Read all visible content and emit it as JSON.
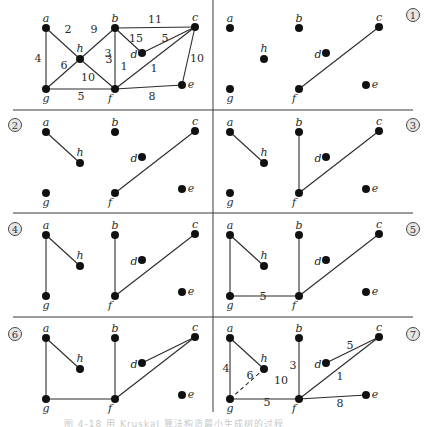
{
  "figure": {
    "vertices": [
      {
        "id": "a",
        "label": "a",
        "x": 46,
        "y": 28,
        "lx": 0,
        "ly": -6,
        "anchor": "middle"
      },
      {
        "id": "b",
        "label": "b",
        "x": 115,
        "y": 28,
        "lx": 0,
        "ly": -6,
        "anchor": "middle"
      },
      {
        "id": "c",
        "label": "c",
        "x": 195,
        "y": 27,
        "lx": 0,
        "ly": -6,
        "anchor": "middle"
      },
      {
        "id": "h",
        "label": "h",
        "x": 80,
        "y": 59,
        "lx": 0,
        "ly": -7,
        "anchor": "middle"
      },
      {
        "id": "d",
        "label": "d",
        "x": 142,
        "y": 53,
        "lx": -8,
        "ly": 5,
        "anchor": "middle"
      },
      {
        "id": "g",
        "label": "g",
        "x": 46,
        "y": 89,
        "lx": 0,
        "ly": 13,
        "anchor": "middle"
      },
      {
        "id": "f",
        "label": "f",
        "x": 115,
        "y": 89,
        "lx": -5,
        "ly": 13,
        "anchor": "middle"
      },
      {
        "id": "e",
        "label": "e",
        "x": 182,
        "y": 85,
        "lx": 9,
        "ly": 3,
        "anchor": "middle"
      }
    ],
    "graph_edges": [
      {
        "u": "a",
        "v": "h",
        "w": "2",
        "wx": 68,
        "wy": 33
      },
      {
        "u": "a",
        "v": "g",
        "w": "4",
        "wx": 38,
        "wy": 62
      },
      {
        "u": "h",
        "v": "b",
        "w": "9",
        "wx": 94,
        "wy": 33
      },
      {
        "u": "h",
        "v": "g",
        "w": "6",
        "wx": 64,
        "wy": 69
      },
      {
        "u": "h",
        "v": "f",
        "w": "10",
        "wx": 88,
        "wy": 81
      },
      {
        "u": "b",
        "v": "c",
        "w": "11",
        "wx": 155,
        "wy": 23
      },
      {
        "u": "b",
        "v": "d",
        "w": "15",
        "wx": 136,
        "wy": 42
      },
      {
        "u": "b",
        "v": "f",
        "w": "3",
        "wx": 109,
        "wy": 63
      },
      {
        "u": "d",
        "v": "c",
        "w": "5",
        "wx": 165,
        "wy": 42
      },
      {
        "u": "f",
        "v": "c",
        "w": "1",
        "wx": 154,
        "wy": 72
      },
      {
        "u": "c",
        "v": "e",
        "w": "10",
        "wx": 197,
        "wy": 62
      },
      {
        "u": "g",
        "v": "f",
        "w": "5",
        "wx": 81,
        "wy": 100
      },
      {
        "u": "f",
        "v": "e",
        "w": "8",
        "wx": 152,
        "wy": 100
      }
    ],
    "panels": [
      {
        "id": "graph",
        "dx": 0,
        "dy": 0,
        "step": "",
        "full_graph": true,
        "edges": [],
        "weights": [],
        "dashed": []
      },
      {
        "id": "step-1",
        "dx": 184,
        "dy": 0,
        "step": "1",
        "edges": [
          [
            "f",
            "c"
          ]
        ],
        "weights": [
          {
            "text": "1",
            "x": 124,
            "y": 70
          }
        ],
        "dashed": []
      },
      {
        "id": "step-2",
        "dx": 0,
        "dy": 104,
        "step": "2",
        "edges": [
          [
            "a",
            "h"
          ],
          [
            "f",
            "c"
          ]
        ],
        "weights": [
          {
            "text": "3",
            "x": 108,
            "y": 57
          }
        ],
        "dashed": []
      },
      {
        "id": "step-3",
        "dx": 184,
        "dy": 104,
        "step": "3",
        "edges": [
          [
            "a",
            "h"
          ],
          [
            "b",
            "f"
          ],
          [
            "f",
            "c"
          ]
        ],
        "weights": [],
        "dashed": []
      },
      {
        "id": "step-4",
        "dx": 0,
        "dy": 207,
        "step": "4",
        "edges": [
          [
            "a",
            "h"
          ],
          [
            "a",
            "g"
          ],
          [
            "b",
            "f"
          ],
          [
            "f",
            "c"
          ]
        ],
        "weights": [],
        "dashed": []
      },
      {
        "id": "step-5",
        "dx": 184,
        "dy": 207,
        "step": "5",
        "edges": [
          [
            "a",
            "h"
          ],
          [
            "a",
            "g"
          ],
          [
            "g",
            "f"
          ],
          [
            "b",
            "f"
          ],
          [
            "f",
            "c"
          ]
        ],
        "weights": [
          {
            "text": "5",
            "x": 263,
            "y": 300
          }
        ],
        "dashed": []
      },
      {
        "id": "step-6",
        "dx": 0,
        "dy": 310,
        "step": "6",
        "edges": [
          [
            "a",
            "h"
          ],
          [
            "a",
            "g"
          ],
          [
            "g",
            "f"
          ],
          [
            "b",
            "f"
          ],
          [
            "f",
            "c"
          ],
          [
            "d",
            "c"
          ]
        ],
        "weights": [],
        "dashed": []
      },
      {
        "id": "step-7",
        "dx": 184,
        "dy": 310,
        "step": "7",
        "edges": [
          [
            "a",
            "h"
          ],
          [
            "a",
            "g"
          ],
          [
            "g",
            "f"
          ],
          [
            "b",
            "f"
          ],
          [
            "f",
            "c"
          ],
          [
            "d",
            "c"
          ],
          [
            "f",
            "e"
          ]
        ],
        "weights": [
          {
            "text": "4",
            "x": 226,
            "y": 372
          },
          {
            "text": "6",
            "x": 250,
            "y": 379
          },
          {
            "text": "10",
            "x": 281,
            "y": 384
          },
          {
            "text": "3",
            "x": 293,
            "y": 369
          },
          {
            "text": "5",
            "x": 350,
            "y": 349
          },
          {
            "text": "1",
            "x": 340,
            "y": 380
          },
          {
            "text": "5",
            "x": 267,
            "y": 406
          },
          {
            "text": "8",
            "x": 340,
            "y": 407
          }
        ],
        "dashed": [
          [
            "g",
            "h"
          ]
        ]
      }
    ],
    "step_labels": [
      "1",
      "2",
      "3",
      "4",
      "5",
      "6",
      "7"
    ],
    "step_label_positions": [
      {
        "step": "1",
        "x": 413,
        "y": 15
      },
      {
        "step": "2",
        "x": 15,
        "y": 125
      },
      {
        "step": "3",
        "x": 413,
        "y": 125
      },
      {
        "step": "4",
        "x": 15,
        "y": 229
      },
      {
        "step": "5",
        "x": 413,
        "y": 229
      },
      {
        "step": "6",
        "x": 15,
        "y": 334
      },
      {
        "step": "7",
        "x": 413,
        "y": 334
      }
    ],
    "caption": "图 4-18 用 Kruskal 算法构造最小生成树的过程"
  },
  "colors": {
    "line": "#2b2b2b",
    "node": "#111111",
    "divider": "#3a3a3a",
    "background": "#ffffff"
  }
}
